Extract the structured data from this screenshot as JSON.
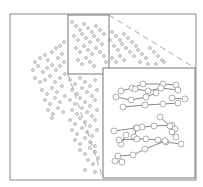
{
  "figure": {
    "colors": {
      "frame": "#8a8a8a",
      "point": "#9a9a9a",
      "line": "#555555",
      "dashed": "#aaaaaa",
      "background": "#ffffff"
    },
    "outer_frame": {
      "x": 10,
      "y": 14,
      "w": 186,
      "h": 166
    },
    "zoom_box": {
      "x": 68,
      "y": 15,
      "w": 41,
      "h": 59
    },
    "inset": {
      "x": 103,
      "y": 68,
      "w": 92,
      "h": 110
    },
    "inset_tracks": [
      [
        [
          121,
          91
        ],
        [
          132,
          88
        ],
        [
          143,
          84
        ],
        [
          163,
          84
        ],
        [
          176,
          85
        ]
      ],
      [
        [
          135,
          89
        ],
        [
          148,
          91
        ],
        [
          161,
          88
        ],
        [
          178,
          90
        ]
      ],
      [
        [
          116,
          97
        ],
        [
          131,
          100
        ],
        [
          146,
          97
        ],
        [
          156,
          93
        ]
      ],
      [
        [
          123,
          107
        ],
        [
          145,
          105
        ],
        [
          163,
          104
        ],
        [
          178,
          103
        ]
      ],
      [
        [
          172,
          98
        ],
        [
          185,
          99
        ]
      ],
      [
        [
          114,
          131
        ],
        [
          136,
          128
        ],
        [
          142,
          127
        ],
        [
          154,
          126
        ],
        [
          172,
          125
        ]
      ],
      [
        [
          160,
          117
        ],
        [
          170,
          126
        ],
        [
          175,
          129
        ]
      ],
      [
        [
          126,
          135
        ],
        [
          121,
          144
        ]
      ],
      [
        [
          137,
          128
        ],
        [
          134,
          137
        ]
      ],
      [
        [
          119,
          140
        ],
        [
          137,
          139
        ],
        [
          146,
          139
        ],
        [
          158,
          140
        ],
        [
          166,
          142
        ],
        [
          181,
          144
        ]
      ],
      [
        [
          172,
          132
        ],
        [
          176,
          137
        ]
      ],
      [
        [
          118,
          156
        ],
        [
          133,
          155
        ],
        [
          145,
          149
        ],
        [
          165,
          141
        ]
      ],
      [
        [
          115,
          161
        ],
        [
          122,
          162
        ]
      ]
    ],
    "scatter_points": [
      [
        35,
        62
      ],
      [
        40,
        58
      ],
      [
        45,
        55
      ],
      [
        48,
        60
      ],
      [
        52,
        52
      ],
      [
        56,
        48
      ],
      [
        60,
        46
      ],
      [
        64,
        42
      ],
      [
        58,
        58
      ],
      [
        62,
        54
      ],
      [
        33,
        70
      ],
      [
        38,
        66
      ],
      [
        43,
        72
      ],
      [
        47,
        68
      ],
      [
        52,
        65
      ],
      [
        56,
        70
      ],
      [
        60,
        66
      ],
      [
        64,
        62
      ],
      [
        50,
        76
      ],
      [
        45,
        80
      ],
      [
        35,
        78
      ],
      [
        40,
        82
      ],
      [
        55,
        82
      ],
      [
        60,
        78
      ],
      [
        65,
        74
      ],
      [
        42,
        90
      ],
      [
        47,
        94
      ],
      [
        52,
        88
      ],
      [
        57,
        92
      ],
      [
        62,
        86
      ],
      [
        45,
        100
      ],
      [
        50,
        104
      ],
      [
        55,
        98
      ],
      [
        60,
        102
      ],
      [
        65,
        96
      ],
      [
        48,
        110
      ],
      [
        53,
        114
      ],
      [
        58,
        108
      ],
      [
        63,
        112
      ],
      [
        52,
        118
      ],
      [
        70,
        80
      ],
      [
        75,
        84
      ],
      [
        80,
        78
      ],
      [
        85,
        82
      ],
      [
        90,
        86
      ],
      [
        95,
        80
      ],
      [
        72,
        90
      ],
      [
        77,
        94
      ],
      [
        82,
        88
      ],
      [
        87,
        92
      ],
      [
        92,
        96
      ],
      [
        97,
        90
      ],
      [
        70,
        100
      ],
      [
        75,
        104
      ],
      [
        80,
        98
      ],
      [
        85,
        102
      ],
      [
        90,
        106
      ],
      [
        95,
        100
      ],
      [
        72,
        110
      ],
      [
        77,
        114
      ],
      [
        82,
        108
      ],
      [
        87,
        112
      ],
      [
        92,
        116
      ],
      [
        97,
        110
      ],
      [
        70,
        120
      ],
      [
        75,
        124
      ],
      [
        80,
        118
      ],
      [
        85,
        122
      ],
      [
        90,
        126
      ],
      [
        95,
        120
      ],
      [
        72,
        130
      ],
      [
        77,
        134
      ],
      [
        82,
        128
      ],
      [
        87,
        132
      ],
      [
        92,
        136
      ],
      [
        97,
        130
      ],
      [
        75,
        140
      ],
      [
        80,
        144
      ],
      [
        85,
        138
      ],
      [
        90,
        142
      ],
      [
        95,
        146
      ],
      [
        80,
        150
      ],
      [
        85,
        154
      ],
      [
        90,
        148
      ],
      [
        95,
        152
      ],
      [
        88,
        160
      ],
      [
        93,
        164
      ],
      [
        98,
        158
      ],
      [
        85,
        170
      ],
      [
        95,
        172
      ],
      [
        72,
        22
      ],
      [
        76,
        26
      ],
      [
        80,
        30
      ],
      [
        84,
        24
      ],
      [
        88,
        28
      ],
      [
        92,
        32
      ],
      [
        96,
        26
      ],
      [
        100,
        30
      ],
      [
        104,
        34
      ],
      [
        74,
        36
      ],
      [
        78,
        40
      ],
      [
        82,
        34
      ],
      [
        86,
        38
      ],
      [
        90,
        42
      ],
      [
        94,
        36
      ],
      [
        98,
        40
      ],
      [
        102,
        44
      ],
      [
        76,
        48
      ],
      [
        80,
        52
      ],
      [
        84,
        46
      ],
      [
        88,
        50
      ],
      [
        92,
        54
      ],
      [
        96,
        48
      ],
      [
        100,
        52
      ],
      [
        104,
        56
      ],
      [
        78,
        60
      ],
      [
        82,
        64
      ],
      [
        86,
        58
      ],
      [
        90,
        62
      ],
      [
        94,
        66
      ],
      [
        112,
        32
      ],
      [
        116,
        36
      ],
      [
        120,
        40
      ],
      [
        124,
        34
      ],
      [
        128,
        38
      ],
      [
        132,
        42
      ],
      [
        136,
        46
      ],
      [
        114,
        46
      ],
      [
        118,
        50
      ],
      [
        122,
        44
      ],
      [
        126,
        48
      ],
      [
        130,
        52
      ],
      [
        134,
        56
      ],
      [
        138,
        50
      ],
      [
        142,
        54
      ],
      [
        146,
        58
      ],
      [
        112,
        58
      ],
      [
        116,
        62
      ],
      [
        120,
        56
      ],
      [
        124,
        60
      ],
      [
        150,
        48
      ],
      [
        154,
        52
      ],
      [
        158,
        56
      ],
      [
        162,
        60
      ],
      [
        140,
        62
      ],
      [
        148,
        64
      ],
      [
        156,
        64
      ],
      [
        164,
        62
      ],
      [
        110,
        40
      ],
      [
        106,
        62
      ]
    ]
  }
}
